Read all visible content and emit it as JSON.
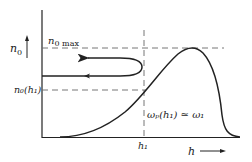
{
  "diagram": {
    "y_axis_label": "n",
    "y_axis_sub": "0",
    "x_axis_label": "h",
    "n0max_label_main": "n",
    "n0max_label_sub": "0 max",
    "n0h1_label": "n₀(h₁)",
    "h1_label": "h₁",
    "resonance_label": "ωₚ(h₁) ≃ ω₁",
    "colors": {
      "line": "#222222",
      "dashed": "#555555",
      "background": "#ffffff"
    }
  }
}
